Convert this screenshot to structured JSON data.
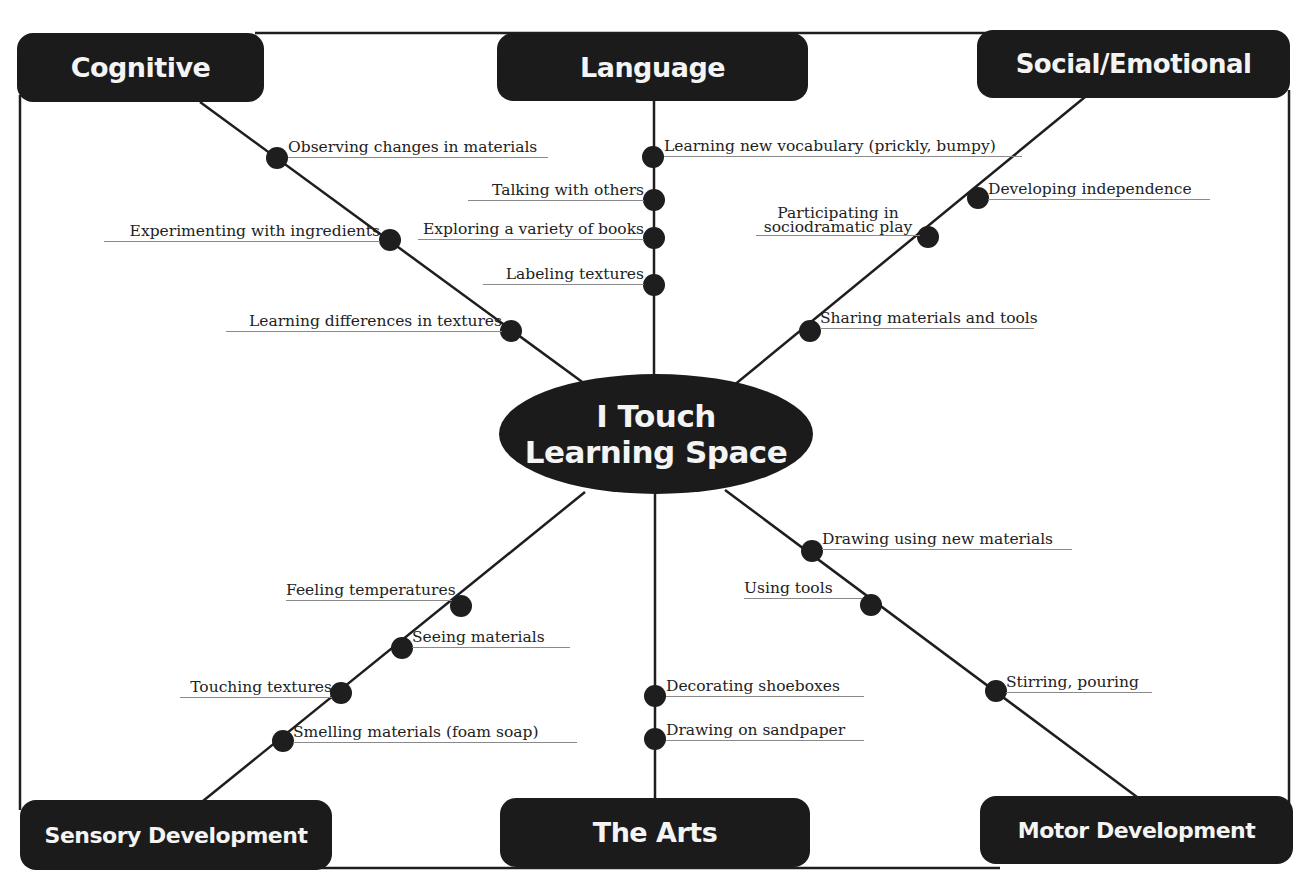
{
  "center": {
    "line1": "I Touch",
    "line2": "Learning Space"
  },
  "categories": {
    "cognitive": {
      "label": "Cognitive",
      "items": [
        "Observing changes in materials",
        "Experimenting with ingredients",
        "Learning differences in textures"
      ]
    },
    "language": {
      "label": "Language",
      "items": [
        "Learning new vocabulary (prickly, bumpy)",
        "Talking  with others",
        "Exploring a variety of books",
        "Labeling textures"
      ]
    },
    "social_emotional": {
      "label": "Social/Emotional",
      "items": [
        "Developing independence",
        "Participating in sociodramatic play",
        "Sharing materials and tools"
      ]
    },
    "sensory_development": {
      "label": "Sensory Development",
      "items": [
        "Feeling temperatures",
        "Seeing materials",
        "Touching textures",
        "Smelling materials (foam soap)"
      ]
    },
    "the_arts": {
      "label": "The Arts",
      "items": [
        "Decorating shoeboxes",
        "Drawing on sandpaper"
      ]
    },
    "motor_development": {
      "label": "Motor Development",
      "items": [
        "Drawing using new materials",
        "Using tools",
        "Stirring, pouring"
      ]
    }
  },
  "colors": {
    "box_fill": "#1b1b1b",
    "box_text": "#f4f4f4",
    "line": "#1e1e1e",
    "underline": "#8a8a8a"
  }
}
